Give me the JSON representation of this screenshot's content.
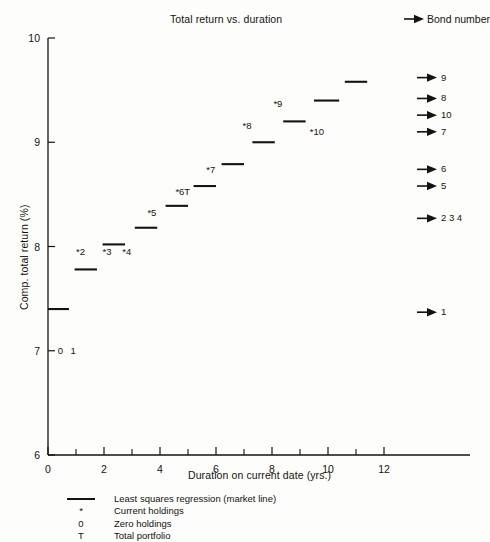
{
  "chart_data": {
    "type": "scatter",
    "title": "Total return vs. duration",
    "xlabel": "Duration on current date (yrs.)",
    "ylabel": "Comp. total return (%)",
    "xlim": [
      0,
      13
    ],
    "ylim": [
      6,
      10
    ],
    "xticks": [
      0,
      2,
      4,
      6,
      8,
      10,
      12
    ],
    "xtick_labels": [
      "0",
      "2",
      "4",
      "6",
      "8",
      "10",
      "12"
    ],
    "xminor_ticks": [
      1,
      3,
      5,
      7,
      9,
      11
    ],
    "yticks": [
      6,
      7,
      8,
      9,
      10
    ],
    "ytick_labels": [
      "6",
      "7",
      "8",
      "9",
      "10"
    ],
    "grid": false,
    "legend_position": "below-axes",
    "market_line_note": "Least squares regression drawn as short horizontal step segments, one per bond",
    "segments": [
      {
        "bond": "1",
        "x_start": 0.0,
        "x_end": 0.75,
        "y": 7.4
      },
      {
        "bond": "2",
        "x_start": 0.95,
        "x_end": 1.75,
        "y": 7.78
      },
      {
        "bond": "3",
        "x_start": 1.95,
        "x_end": 2.75,
        "y": 8.02
      },
      {
        "bond": "4",
        "x_start": 3.1,
        "x_end": 3.9,
        "y": 8.18
      },
      {
        "bond": "5",
        "x_start": 4.2,
        "x_end": 5.0,
        "y": 8.39
      },
      {
        "bond": "6T",
        "x_start": 5.2,
        "x_end": 6.0,
        "y": 8.58
      },
      {
        "bond": "7",
        "x_start": 6.2,
        "x_end": 7.0,
        "y": 8.79
      },
      {
        "bond": "8",
        "x_start": 7.3,
        "x_end": 8.1,
        "y": 9.0
      },
      {
        "bond": "9",
        "x_start": 8.4,
        "x_end": 9.2,
        "y": 9.2
      },
      {
        "bond": "10",
        "x_start": 9.5,
        "x_end": 10.4,
        "y": 9.4
      },
      {
        "bond": "11",
        "x_start": 10.6,
        "x_end": 11.4,
        "y": 9.58
      }
    ],
    "point_labels": [
      {
        "text": "0",
        "x": 0.35,
        "y": 7.0,
        "kind": "zero-holdings"
      },
      {
        "text": "1",
        "x": 0.8,
        "y": 7.0,
        "kind": "zero-holdings"
      },
      {
        "text": "*2",
        "x": 1.0,
        "y": 7.95,
        "kind": "current-holding"
      },
      {
        "text": "*3",
        "x": 1.95,
        "y": 7.95,
        "kind": "current-holding"
      },
      {
        "text": "*4",
        "x": 2.65,
        "y": 7.95,
        "kind": "current-holding"
      },
      {
        "text": "*5",
        "x": 3.55,
        "y": 8.32,
        "kind": "current-holding"
      },
      {
        "text": "*6T",
        "x": 4.55,
        "y": 8.52,
        "kind": "total-portfolio"
      },
      {
        "text": "*7",
        "x": 5.65,
        "y": 8.73,
        "kind": "current-holding"
      },
      {
        "text": "*8",
        "x": 6.95,
        "y": 9.16,
        "kind": "current-holding"
      },
      {
        "text": "*9",
        "x": 8.05,
        "y": 9.37,
        "kind": "current-holding"
      },
      {
        "text": "*10",
        "x": 9.35,
        "y": 9.1,
        "kind": "current-holding"
      }
    ],
    "bond_number_axis": {
      "header": "Bond number",
      "entries": [
        {
          "labels": "9",
          "y": 9.62
        },
        {
          "labels": "8",
          "y": 9.42
        },
        {
          "labels": "10",
          "y": 9.26
        },
        {
          "labels": "7",
          "y": 9.1
        },
        {
          "labels": "6",
          "y": 8.74
        },
        {
          "labels": "5",
          "y": 8.58
        },
        {
          "labels": "2 3 4",
          "y": 8.27
        },
        {
          "labels": "1",
          "y": 7.37
        }
      ]
    },
    "legend_entries": [
      {
        "symbol": "line",
        "label": "Least squares regression (market line)"
      },
      {
        "symbol": "*",
        "label": "Current holdings"
      },
      {
        "symbol": "0",
        "label": "Zero holdings"
      },
      {
        "symbol": "T",
        "label": "Total portfolio"
      }
    ],
    "colors": {
      "ink": "#15130f",
      "background": "#fdfdfb"
    }
  }
}
